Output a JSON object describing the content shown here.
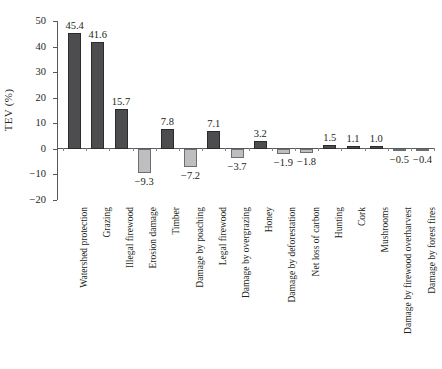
{
  "chart_data": {
    "type": "bar",
    "title": "",
    "subtitle": "",
    "xlabel": "",
    "ylabel": "TEV (%)",
    "ylim": [
      -20,
      50
    ],
    "yticks": [
      50,
      40,
      30,
      20,
      10,
      0,
      -10,
      -20
    ],
    "ytick_labels": [
      "50",
      "40",
      "30",
      "20",
      "10",
      "0",
      "−10",
      "−20"
    ],
    "grid": false,
    "legend": "none",
    "categories": [
      "Watershed protection",
      "Grazing",
      "Illegal firewood",
      "Erosion damage",
      "Timber",
      "Damage by poaching",
      "Legal firewood",
      "Damage by overgrazing",
      "Honey",
      "Damage by deforestation",
      "Net loss of carbon",
      "Hunting",
      "Cork",
      "Mushrooms",
      "Damage by firewood overharvest",
      "Damage by forest fires"
    ],
    "values": [
      45.4,
      41.6,
      15.7,
      -9.3,
      7.8,
      -7.2,
      7.1,
      -3.7,
      3.2,
      -1.9,
      -1.8,
      1.5,
      1.1,
      1.0,
      -0.5,
      -0.4
    ],
    "value_labels": [
      "45.4",
      "41.6",
      "15.7",
      "−9.3",
      "7.8",
      "−7.2",
      "7.1",
      "−3.7",
      "3.2",
      "−1.9",
      "−1.8",
      "1.5",
      "1.1",
      "1.0",
      "−0.5",
      "−0.4"
    ],
    "colors": {
      "positive_bar": "#4d4d4f",
      "positive_bar_edge": "#2b2b2d",
      "negative_bar": "#bcbec0",
      "negative_bar_edge": "#6d6e71",
      "axis": "#58595b",
      "text": "#231f20",
      "background": "#ffffff"
    }
  }
}
